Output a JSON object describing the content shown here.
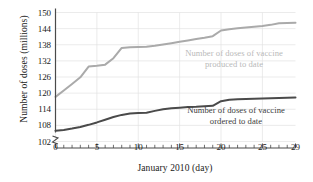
{
  "chart_data": {
    "type": "line",
    "title": "",
    "xlabel": "January 2010 (day)",
    "ylabel": "Number of doses (millions)",
    "xlim": [
      0,
      29
    ],
    "ylim": [
      102,
      150
    ],
    "xticks": [
      0,
      5,
      10,
      15,
      20,
      25,
      29
    ],
    "xtick_labels": [
      "0",
      "5",
      "10",
      "15",
      "20",
      "25",
      "29"
    ],
    "xminor_step": 1,
    "yticks": [
      102,
      108,
      114,
      120,
      126,
      132,
      138,
      144,
      150
    ],
    "ytick_labels": [
      "102",
      "108",
      "114",
      "120",
      "126",
      "132",
      "138",
      "144",
      "150"
    ],
    "grid": true,
    "grid_color": "#e2e2e2",
    "axis_break": true,
    "legend_position": "inline-annotations",
    "series": [
      {
        "name": "Number of doses of vaccine\nproduced to date",
        "color": "#aaaaaa",
        "x": [
          0,
          1,
          2,
          3,
          4,
          5,
          6,
          7,
          8,
          9,
          10,
          11,
          12,
          13,
          14,
          15,
          16,
          17,
          18,
          19,
          20,
          21,
          22,
          23,
          24,
          25,
          26,
          27,
          28,
          29
        ],
        "values": [
          118.6,
          121.0,
          123.4,
          125.9,
          129.9,
          130.2,
          130.6,
          133.0,
          136.8,
          137.1,
          137.2,
          137.3,
          137.6,
          138.1,
          138.6,
          139.1,
          139.6,
          140.1,
          140.6,
          141.2,
          143.3,
          143.8,
          144.1,
          144.4,
          144.7,
          145.0,
          145.4,
          146.0,
          146.1,
          146.2
        ]
      },
      {
        "name": "Number of doses of vaccine\nordered to date",
        "color": "#4a4a4a",
        "x": [
          0,
          1,
          2,
          3,
          4,
          5,
          6,
          7,
          8,
          9,
          10,
          11,
          12,
          13,
          14,
          15,
          16,
          17,
          18,
          19,
          20,
          21,
          22,
          23,
          24,
          25,
          26,
          27,
          28,
          29
        ],
        "values": [
          106.0,
          106.3,
          106.8,
          107.4,
          108.2,
          109.1,
          110.1,
          111.1,
          111.9,
          112.4,
          112.6,
          112.7,
          113.4,
          114.0,
          114.4,
          114.6,
          114.8,
          114.9,
          115.1,
          115.3,
          117.0,
          117.5,
          117.7,
          117.8,
          117.9,
          118.0,
          118.1,
          118.2,
          118.3,
          118.4
        ]
      }
    ]
  },
  "annotations": [
    {
      "name": "produced-label",
      "text": "Number of doses of vaccine\nproduced to date",
      "color": "#b9b9b9"
    },
    {
      "name": "ordered-label",
      "text": "Number of doses of vaccine\nordered to date",
      "color": "#3b3b3b"
    }
  ]
}
